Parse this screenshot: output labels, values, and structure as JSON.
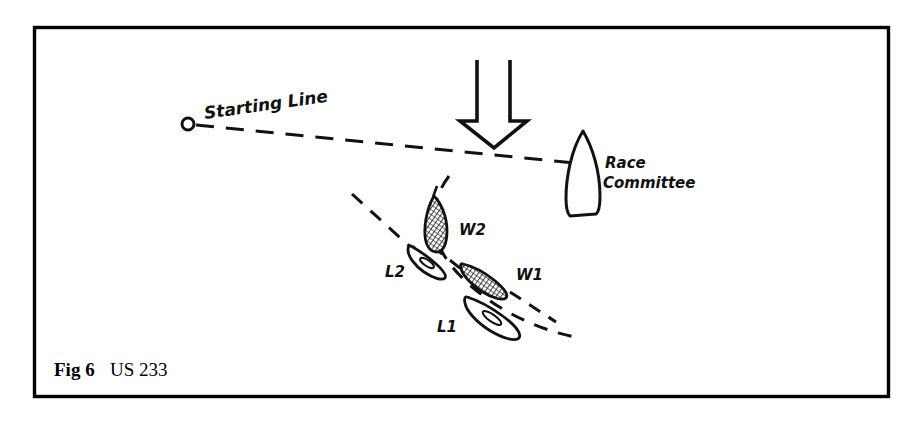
{
  "figure": {
    "caption_label": "Fig 6",
    "caption_reference": "US 233",
    "frame_color": "#000000",
    "background_color": "#ffffff",
    "ink_color": "#111111"
  },
  "annotations": {
    "starting_line": "Starting Line",
    "race_committee_line1": "Race",
    "race_committee_line2": "Committee"
  },
  "boats": [
    {
      "id": "W2",
      "label": "W2",
      "shaded": true,
      "role": "windward-boat-two"
    },
    {
      "id": "W1",
      "label": "W1",
      "shaded": true,
      "role": "windward-boat-one"
    },
    {
      "id": "L2",
      "label": "L2",
      "shaded": false,
      "role": "leeward-boat-two"
    },
    {
      "id": "L1",
      "label": "L1",
      "shaded": false,
      "role": "leeward-boat-one"
    }
  ],
  "marks": {
    "pin_buoy": "o",
    "committee_boat": "race-committee-vessel",
    "wind_arrow": "wind-direction-arrow"
  }
}
